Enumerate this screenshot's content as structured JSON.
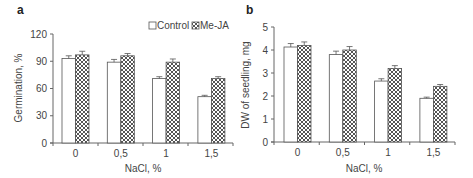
{
  "chart_data": [
    {
      "panel": "a",
      "type": "bar",
      "title": "",
      "xlabel": "NaCl, %",
      "ylabel": "Germination, %",
      "ylim": [
        0,
        120
      ],
      "yticks": [
        "0",
        "30",
        "60",
        "90",
        "120"
      ],
      "categories": [
        "0",
        "0,5",
        "1",
        "1,5"
      ],
      "series": [
        {
          "name": "Control",
          "values": [
            93,
            89,
            71,
            51
          ],
          "errors": [
            3,
            3,
            2,
            1.5
          ]
        },
        {
          "name": "Me-JA",
          "values": [
            97,
            96,
            89,
            71
          ],
          "errors": [
            4,
            2.5,
            3.5,
            2
          ]
        }
      ],
      "legend": {
        "position": "top-right",
        "entries": [
          "Control",
          "Me-JA"
        ]
      },
      "grid": false
    },
    {
      "panel": "b",
      "type": "bar",
      "title": "",
      "xlabel": "NaCl, %",
      "ylabel": "DW of seedling, mg",
      "ylim": [
        0,
        5
      ],
      "yticks": [
        "0",
        "1",
        "2",
        "3",
        "4",
        "5"
      ],
      "categories": [
        "0",
        "0,5",
        "1",
        "1,5"
      ],
      "series": [
        {
          "name": "Control",
          "values": [
            4.13,
            3.8,
            2.65,
            1.9
          ],
          "errors": [
            0.15,
            0.15,
            0.1,
            0.05
          ]
        },
        {
          "name": "Me-JA",
          "values": [
            4.2,
            4.0,
            3.2,
            2.42
          ],
          "errors": [
            0.15,
            0.15,
            0.12,
            0.08
          ]
        }
      ],
      "grid": false
    }
  ],
  "panels": {
    "a": {
      "letter": "a",
      "xlabel": "NaCl, %",
      "ylabel": "Germination, %"
    },
    "b": {
      "letter": "b",
      "xlabel": "NaCl, %",
      "ylabel": "DW of seedling, mg"
    }
  },
  "legend": {
    "control": "Control",
    "meja": "Me-JA"
  },
  "colors": {
    "control_fill": "#ffffff",
    "meja_hatch": "#555555",
    "axis": "#666666",
    "bar_edge": "#555555"
  }
}
